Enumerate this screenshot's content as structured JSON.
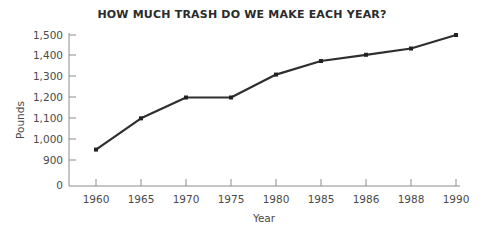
{
  "chart_data": {
    "type": "line",
    "title": "HOW MUCH TRASH DO WE MAKE EACH YEAR?",
    "xlabel": "Year",
    "ylabel": "Pounds",
    "categories": [
      "1960",
      "1965",
      "1970",
      "1975",
      "1980",
      "1985",
      "1986",
      "1988",
      "1990"
    ],
    "values": [
      950,
      1100,
      1200,
      1200,
      1310,
      1375,
      1405,
      1435,
      1500
    ],
    "series": [
      {
        "name": "Pounds of trash per person per year",
        "values": [
          950,
          1100,
          1200,
          1200,
          1310,
          1375,
          1405,
          1435,
          1500
        ]
      }
    ],
    "ytick_labels": [
      "1,500",
      "1,400",
      "1,300",
      "1,200",
      "1,100",
      "1,000",
      "900",
      "0"
    ],
    "ytick_values": [
      1500,
      1400,
      1300,
      1200,
      1100,
      1000,
      900,
      0
    ],
    "ylim": [
      900,
      1500
    ],
    "axis_break": true,
    "grid": false,
    "legend": false,
    "marker": "square",
    "line_color": "#2e2e2e",
    "axis_color": "#8c8c8c",
    "text_color": "#4a4a4a",
    "title_color": "#2b2b2b",
    "background_color": "#ffffff"
  }
}
